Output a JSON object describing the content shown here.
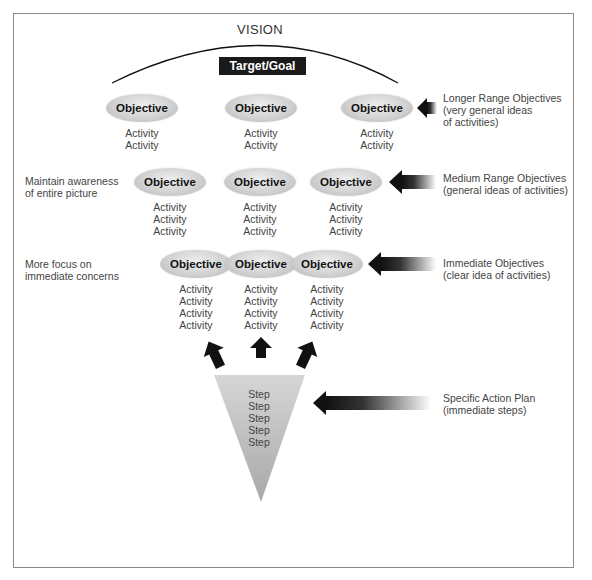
{
  "diagram": {
    "vision_label": "VISION",
    "target_label": "Target/Goal",
    "rows": [
      {
        "name": "longer-range",
        "objectives": [
          {
            "label": "Objective",
            "activities": [
              "Activity",
              "Activity"
            ]
          },
          {
            "label": "Objective",
            "activities": [
              "Activity",
              "Activity"
            ]
          },
          {
            "label": "Objective",
            "activities": [
              "Activity",
              "Activity"
            ]
          }
        ],
        "note": [
          "Longer Range Objectives",
          "(very general ideas",
          "of activities)"
        ]
      },
      {
        "name": "medium-range",
        "left_label": [
          "Maintain awareness",
          "of entire picture"
        ],
        "objectives": [
          {
            "label": "Objective",
            "activities": [
              "Activity",
              "Activity",
              "Activity"
            ]
          },
          {
            "label": "Objective",
            "activities": [
              "Activity",
              "Activity",
              "Activity"
            ]
          },
          {
            "label": "Objective",
            "activities": [
              "Activity",
              "Activity",
              "Activity"
            ]
          }
        ],
        "note": [
          "Medium Range Objectives",
          "(general ideas of activities)"
        ]
      },
      {
        "name": "immediate",
        "left_label": [
          "More focus on",
          "immediate concerns"
        ],
        "objectives": [
          {
            "label": "Objective",
            "activities": [
              "Activity",
              "Activity",
              "Activity",
              "Activity"
            ]
          },
          {
            "label": "Objective",
            "activities": [
              "Activity",
              "Activity",
              "Activity",
              "Activity"
            ]
          },
          {
            "label": "Objective",
            "activities": [
              "Activity",
              "Activity",
              "Activity",
              "Activity"
            ]
          }
        ],
        "note": [
          "Immediate Objectives",
          "(clear idea of activities)"
        ]
      }
    ],
    "action_plan": {
      "steps": [
        "Step",
        "Step",
        "Step",
        "Step",
        "Step"
      ],
      "note": [
        "Specific Action Plan",
        "(immediate steps)"
      ]
    },
    "colors": {
      "frame": "#8a8a8a",
      "target_bg": "#1a1a1a",
      "ellipse_light": "#eeeeee",
      "ellipse_dark": "#b4b4b4",
      "arrow_dark": "#111111"
    }
  }
}
